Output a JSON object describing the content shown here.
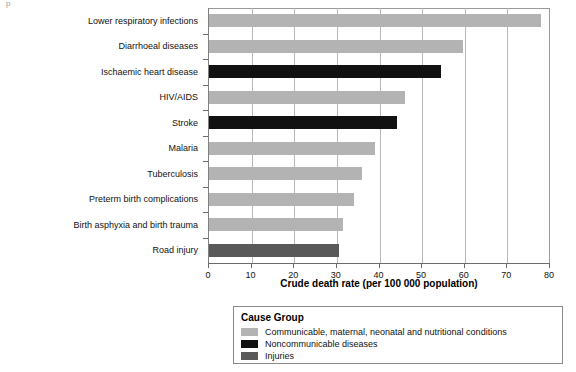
{
  "artifact_text": "p",
  "chart_data": {
    "type": "bar",
    "orientation": "horizontal",
    "title": "",
    "xlabel": "Crude death rate (per 100 000 population)",
    "ylabel": "",
    "xlim": [
      0,
      80
    ],
    "xticks": [
      0,
      10,
      20,
      30,
      40,
      50,
      60,
      70,
      80
    ],
    "xtick_labels": [
      "0",
      "10",
      "20",
      "30",
      "40",
      "50",
      "60",
      "70",
      "80"
    ],
    "grid": "vertical",
    "legend_position": "below-plot",
    "categories": [
      "Lower respiratory infections",
      "Diarrhoeal diseases",
      "Ischaemic heart disease",
      "HIV/AIDS",
      "Stroke",
      "Malaria",
      "Tuberculosis",
      "Preterm birth complications",
      "Birth asphyxia and birth trauma",
      "Road injury"
    ],
    "values": [
      78,
      59.5,
      54.5,
      46,
      44,
      39,
      36,
      34,
      31.5,
      30.5
    ],
    "groups": [
      "Communicable, maternal, neonatal and nutritional conditions",
      "Communicable, maternal, neonatal and nutritional conditions",
      "Noncommunicable diseases",
      "Communicable, maternal, neonatal and nutritional conditions",
      "Noncommunicable diseases",
      "Communicable, maternal, neonatal and nutritional conditions",
      "Communicable, maternal, neonatal and nutritional conditions",
      "Communicable, maternal, neonatal and nutritional conditions",
      "Communicable, maternal, neonatal and nutritional conditions",
      "Injuries"
    ],
    "bar_colors": [
      "#b3b3b3",
      "#b3b3b3",
      "#111111",
      "#b3b3b3",
      "#111111",
      "#b3b3b3",
      "#b3b3b3",
      "#b3b3b3",
      "#b3b3b3",
      "#595959"
    ]
  },
  "legend": {
    "title": "Cause Group",
    "items": [
      {
        "label": "Communicable, maternal, neonatal and nutritional conditions",
        "color": "#b3b3b3"
      },
      {
        "label": "Noncommunicable diseases",
        "color": "#111111"
      },
      {
        "label": "Injuries",
        "color": "#595959"
      }
    ]
  },
  "colors": {
    "communicable": "#b3b3b3",
    "noncommunicable": "#111111",
    "injuries": "#595959",
    "gridline": "#b8b8b8",
    "axis": "#6b6b6b",
    "text": "#111111"
  }
}
